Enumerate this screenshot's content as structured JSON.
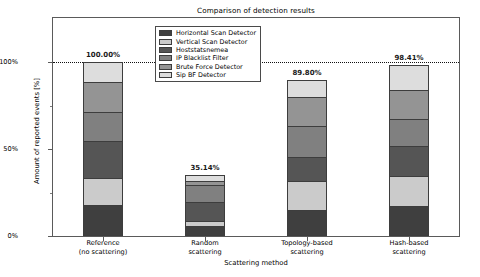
{
  "chart_data": {
    "type": "bar",
    "variant": "stacked-bar",
    "title": "Comparison of detection results",
    "xlabel": "Scattering method",
    "ylabel": "Amount of reported events [%]",
    "ylim": [
      0,
      115
    ],
    "grid": false,
    "legend_position": "upper center",
    "categories": [
      "Reference\n(no scattering)",
      "Random\nscattering",
      "Topology-based\nscattering",
      "Hash-based\nscattering"
    ],
    "category_lines": [
      [
        "Reference",
        "(no scattering)"
      ],
      [
        "Random",
        "scattering"
      ],
      [
        "Topology-based",
        "scattering"
      ],
      [
        "Hash-based",
        "scattering"
      ]
    ],
    "yticks": [
      "0%",
      "50%",
      "100%"
    ],
    "ytick_values": [
      0,
      50,
      100
    ],
    "reference_line": 100,
    "totals": [
      100.0,
      35.14,
      89.8,
      98.41
    ],
    "total_labels": [
      "100.00%",
      "35.14%",
      "89.80%",
      "98.41%"
    ],
    "series": [
      {
        "name": "Horizontal Scan Detector",
        "color": "#3f3f3f",
        "values": [
          16.6,
          4.6,
          13.7,
          16.0
        ]
      },
      {
        "name": "Vertical Scan Detector",
        "color": "#cbcbcb",
        "values": [
          16.0,
          2.9,
          17.1,
          17.7
        ]
      },
      {
        "name": "Hoststatsnemea",
        "color": "#555555",
        "values": [
          21.7,
          11.4,
          13.7,
          17.7
        ]
      },
      {
        "name": "IP Blacklist Filter",
        "color": "#808080",
        "values": [
          16.6,
          10.3,
          18.3,
          15.4
        ]
      },
      {
        "name": "Brute Force Detector",
        "color": "#949494",
        "values": [
          17.7,
          2.3,
          16.6,
          17.1
        ]
      },
      {
        "name": "Sip BF Detector",
        "color": "#dddddd",
        "values": [
          11.4,
          3.7,
          10.3,
          14.5
        ]
      }
    ]
  },
  "legend": {
    "items": [
      {
        "label": "Horizontal Scan Detector",
        "swatch": "#3f3f3f"
      },
      {
        "label": "Vertical Scan Detector",
        "swatch": "#cbcbcb"
      },
      {
        "label": "Hoststatsnemea",
        "swatch": "#555555"
      },
      {
        "label": "IP Blacklist Filter",
        "swatch": "#808080"
      },
      {
        "label": "Brute Force Detector",
        "swatch": "#949494"
      },
      {
        "label": "Sip BF Detector",
        "swatch": "#dddddd"
      }
    ]
  },
  "colors": {
    "axis": "#5a5a5a",
    "bar_edge": "#3d3d3d",
    "text": "#000000",
    "background": "#ffffff"
  }
}
